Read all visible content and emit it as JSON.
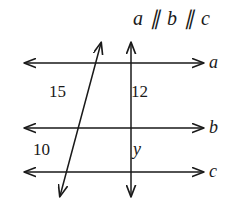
{
  "figure": {
    "title": "a ∥ b ∥ c",
    "background_color": "#ffffff",
    "stroke_color": "#1a1a1a",
    "width": 243,
    "height": 202
  },
  "parallel_lines": [
    {
      "id": "a",
      "label": "a",
      "y": 63,
      "x_start": 25,
      "x_end": 203
    },
    {
      "id": "b",
      "label": "b",
      "y": 128,
      "x_start": 25,
      "x_end": 203
    },
    {
      "id": "c",
      "label": "c",
      "y": 172,
      "x_start": 25,
      "x_end": 203
    }
  ],
  "transversals": [
    {
      "id": "slanted-transversal",
      "x_top": 101,
      "y_top": 43,
      "x_bottom": 60,
      "y_bottom": 196
    },
    {
      "id": "vertical-transversal",
      "x_top": 131,
      "y_top": 43,
      "x_bottom": 131,
      "y_bottom": 196
    }
  ],
  "segment_labels": [
    {
      "id": "seg-15",
      "text": "15",
      "transversal": "slanted-transversal",
      "between": "a-b"
    },
    {
      "id": "seg-12",
      "text": "12",
      "transversal": "vertical-transversal",
      "between": "a-b"
    },
    {
      "id": "seg-10",
      "text": "10",
      "transversal": "slanted-transversal",
      "between": "b-c"
    },
    {
      "id": "seg-y",
      "text": "y",
      "transversal": "vertical-transversal",
      "between": "b-c"
    }
  ]
}
